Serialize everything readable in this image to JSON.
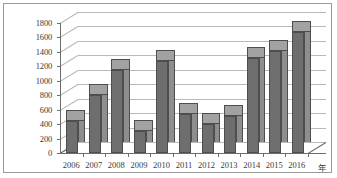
{
  "chart_data": {
    "type": "bar",
    "title": "",
    "xlabel": "年",
    "ylabel": "",
    "categories": [
      "2006",
      "2007",
      "2008",
      "2009",
      "2010",
      "2011",
      "2012",
      "2013",
      "2014",
      "2015",
      "2016"
    ],
    "values": [
      440,
      800,
      1150,
      310,
      1270,
      540,
      400,
      510,
      1320,
      1410,
      1680
    ],
    "ylim": [
      0,
      1800
    ],
    "ytick_step": 200,
    "yticks": [
      "1800",
      "1600",
      "1400",
      "1200",
      "1000",
      "800",
      "600",
      "400",
      "200",
      "0"
    ],
    "ytick_values": [
      1800,
      1600,
      1400,
      1200,
      1000,
      800,
      600,
      400,
      200,
      0
    ],
    "grid": true,
    "legend": false,
    "legend_position": "none",
    "style": "3d-bar",
    "series": [
      {
        "name": "",
        "values": [
          440,
          800,
          1150,
          310,
          1270,
          540,
          400,
          510,
          1320,
          1410,
          1680
        ]
      }
    ]
  },
  "colors": {
    "bar_front": "#6e6e6e",
    "bar_side": "#8e8e8e",
    "bar_top": "#a2a2a2",
    "bar_outline": "#4e4e4e",
    "gridline": "#b9b9b9",
    "axis": "#6d6d6d",
    "text": "#3b3b3b",
    "frame": "#9a9a9a",
    "background": "#ffffff"
  }
}
